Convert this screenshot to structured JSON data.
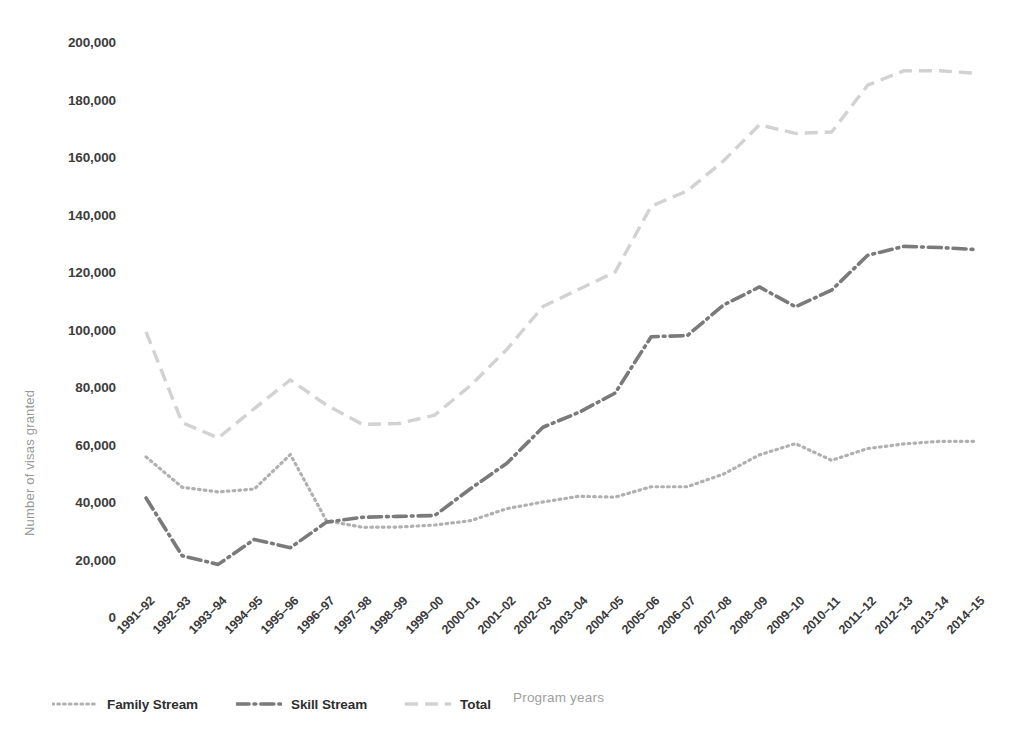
{
  "chart_data": {
    "type": "line",
    "title": "",
    "xlabel": "Program years",
    "ylabel": "Number of visas granted",
    "ylim": [
      0,
      200000
    ],
    "ytick_step": 20000,
    "grid": false,
    "legend_position": "bottom-left",
    "ytick_labels": [
      "200,000",
      "180,000",
      "160,000",
      "140,000",
      "120,000",
      "100,000",
      "80,000",
      "60,000",
      "40,000",
      "20,000",
      "0"
    ],
    "ytick_values": [
      200000,
      180000,
      160000,
      140000,
      120000,
      100000,
      80000,
      60000,
      40000,
      20000,
      0
    ],
    "categories": [
      "1991–92",
      "1992–93",
      "1993–94",
      "1994–95",
      "1995–96",
      "1996–97",
      "1997–98",
      "1998–99",
      "1999–00",
      "2000–01",
      "2001–02",
      "2002–03",
      "2003–04",
      "2004–05",
      "2005–06",
      "2006–07",
      "2007–08",
      "2008–09",
      "2009–10",
      "2010–11",
      "2011–12",
      "2012–13",
      "2013–14",
      "2014–15"
    ],
    "series": [
      {
        "name": "Family Stream",
        "style": "dotted",
        "color": "#b0b0b0",
        "values": [
          55700,
          45100,
          43500,
          44500,
          56500,
          33500,
          31200,
          31300,
          32000,
          33500,
          37700,
          40000,
          42000,
          41700,
          45300,
          45300,
          49700,
          56400,
          60300,
          54500,
          58600,
          60200,
          61100,
          61100
        ]
      },
      {
        "name": "Skill Stream",
        "style": "dashdot",
        "color": "#7a7a7a",
        "values": [
          41400,
          21300,
          18300,
          27000,
          24100,
          33000,
          34700,
          35000,
          35300,
          44700,
          53500,
          66000,
          71200,
          77900,
          97500,
          97900,
          108500,
          114800,
          107900,
          113700,
          125800,
          128900,
          128500,
          127800
        ]
      },
      {
        "name": "Total",
        "style": "dashed",
        "color": "#d2d2d2",
        "values": [
          99200,
          67600,
          62300,
          72500,
          82500,
          73700,
          67000,
          67300,
          70200,
          80600,
          93100,
          108000,
          114000,
          120000,
          142900,
          148200,
          158600,
          171200,
          168200,
          168700,
          185000,
          190000,
          190000,
          189100
        ]
      }
    ]
  },
  "legend": {
    "items": [
      {
        "label": "Family Stream",
        "style": "dotted",
        "color": "#b0b0b0"
      },
      {
        "label": "Skill Stream",
        "style": "dashdot",
        "color": "#7a7a7a"
      },
      {
        "label": "Total",
        "style": "dashed",
        "color": "#d2d2d2"
      }
    ]
  },
  "axis": {
    "x_title": "Program years",
    "y_title": "Number of visas granted"
  }
}
